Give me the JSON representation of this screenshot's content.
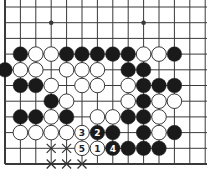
{
  "diagram": {
    "type": "go-board-fragment",
    "grid": {
      "columns": 14,
      "rows": 11,
      "origin_x": 5,
      "origin_y": 7,
      "spacing_x": 15.4,
      "spacing_y": 15.7,
      "left_edge": true,
      "bottom_edge": true,
      "top_edge": false,
      "right_edge": false
    },
    "colors": {
      "line": "#3a3a3a",
      "black_stone": "#1a1a1a",
      "white_stone": "#ffffff",
      "stone_outline": "#222222"
    },
    "star_points": [
      {
        "col": 3,
        "row": 1
      },
      {
        "col": 9,
        "row": 1
      }
    ],
    "stones": [
      {
        "col": 1,
        "row": 3,
        "color": "black"
      },
      {
        "col": 2,
        "row": 3,
        "color": "white"
      },
      {
        "col": 3,
        "row": 3,
        "color": "white"
      },
      {
        "col": 4,
        "row": 3,
        "color": "black"
      },
      {
        "col": 5,
        "row": 3,
        "color": "black"
      },
      {
        "col": 6,
        "row": 3,
        "color": "black"
      },
      {
        "col": 7,
        "row": 3,
        "color": "black"
      },
      {
        "col": 8,
        "row": 3,
        "color": "black"
      },
      {
        "col": 9,
        "row": 3,
        "color": "white"
      },
      {
        "col": 10,
        "row": 3,
        "color": "white"
      },
      {
        "col": 11,
        "row": 3,
        "color": "black"
      },
      {
        "col": 0,
        "row": 4,
        "color": "black"
      },
      {
        "col": 1,
        "row": 4,
        "color": "white"
      },
      {
        "col": 2,
        "row": 4,
        "color": "white"
      },
      {
        "col": 4,
        "row": 4,
        "color": "white"
      },
      {
        "col": 5,
        "row": 4,
        "color": "white"
      },
      {
        "col": 6,
        "row": 4,
        "color": "white"
      },
      {
        "col": 8,
        "row": 4,
        "color": "black"
      },
      {
        "col": 9,
        "row": 4,
        "color": "black"
      },
      {
        "col": 1,
        "row": 5,
        "color": "black"
      },
      {
        "col": 2,
        "row": 5,
        "color": "black"
      },
      {
        "col": 3,
        "row": 5,
        "color": "white"
      },
      {
        "col": 5,
        "row": 5,
        "color": "white"
      },
      {
        "col": 6,
        "row": 5,
        "color": "white"
      },
      {
        "col": 8,
        "row": 5,
        "color": "white"
      },
      {
        "col": 9,
        "row": 5,
        "color": "black"
      },
      {
        "col": 10,
        "row": 5,
        "color": "black"
      },
      {
        "col": 11,
        "row": 5,
        "color": "black"
      },
      {
        "col": 3,
        "row": 6,
        "color": "black"
      },
      {
        "col": 4,
        "row": 6,
        "color": "white"
      },
      {
        "col": 8,
        "row": 6,
        "color": "white"
      },
      {
        "col": 9,
        "row": 6,
        "color": "black"
      },
      {
        "col": 10,
        "row": 6,
        "color": "white"
      },
      {
        "col": 11,
        "row": 6,
        "color": "white"
      },
      {
        "col": 1,
        "row": 7,
        "color": "black"
      },
      {
        "col": 2,
        "row": 7,
        "color": "black"
      },
      {
        "col": 3,
        "row": 7,
        "color": "white"
      },
      {
        "col": 4,
        "row": 7,
        "color": "black"
      },
      {
        "col": 6,
        "row": 7,
        "color": "white"
      },
      {
        "col": 7,
        "row": 7,
        "color": "white"
      },
      {
        "col": 8,
        "row": 7,
        "color": "black"
      },
      {
        "col": 9,
        "row": 7,
        "color": "black"
      },
      {
        "col": 10,
        "row": 7,
        "color": "white"
      },
      {
        "col": 1,
        "row": 8,
        "color": "white"
      },
      {
        "col": 2,
        "row": 8,
        "color": "white"
      },
      {
        "col": 3,
        "row": 8,
        "color": "white"
      },
      {
        "col": 4,
        "row": 8,
        "color": "white"
      },
      {
        "col": 5,
        "row": 8,
        "color": "white",
        "label": "3"
      },
      {
        "col": 6,
        "row": 8,
        "color": "black",
        "label": "2"
      },
      {
        "col": 7,
        "row": 8,
        "color": "black"
      },
      {
        "col": 9,
        "row": 8,
        "color": "black"
      },
      {
        "col": 10,
        "row": 8,
        "color": "white"
      },
      {
        "col": 11,
        "row": 8,
        "color": "black"
      },
      {
        "col": 5,
        "row": 9,
        "color": "white",
        "label": "5"
      },
      {
        "col": 6,
        "row": 9,
        "color": "white",
        "label": "1"
      },
      {
        "col": 7,
        "row": 9,
        "color": "black",
        "label": "4"
      },
      {
        "col": 8,
        "row": 9,
        "color": "black"
      },
      {
        "col": 9,
        "row": 9,
        "color": "black"
      },
      {
        "col": 10,
        "row": 9,
        "color": "black"
      }
    ],
    "marks": [
      {
        "col": 3,
        "row": 9,
        "type": "x"
      },
      {
        "col": 4,
        "row": 9,
        "type": "x"
      },
      {
        "col": 3,
        "row": 10,
        "type": "x"
      },
      {
        "col": 4,
        "row": 10,
        "type": "x"
      },
      {
        "col": 5,
        "row": 10,
        "type": "x"
      }
    ]
  }
}
